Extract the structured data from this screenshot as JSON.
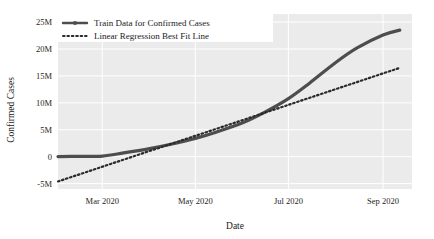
{
  "chart_data": {
    "type": "line",
    "title": "",
    "xlabel": "Date",
    "ylabel": "Confirmed Cases",
    "grid": true,
    "legend_position": "top-left",
    "xlim": [
      "2020-02-01",
      "2020-09-20"
    ],
    "ylim": [
      -6000000,
      26500000
    ],
    "xticks": [
      "Mar 2020",
      "May 2020",
      "Jul 2020",
      "Sep 2020"
    ],
    "xtick_values": [
      "2020-03-01",
      "2020-05-01",
      "2020-07-01",
      "2020-09-01"
    ],
    "yticks": [
      "-5M",
      "0",
      "5M",
      "10M",
      "15M",
      "20M",
      "25M"
    ],
    "ytick_values": [
      -5000000,
      0,
      5000000,
      10000000,
      15000000,
      20000000,
      25000000
    ],
    "series": [
      {
        "name": "Train Data for Confirmed Cases",
        "style": "solid",
        "color": "#4d4d4d",
        "width": 3.2,
        "marker": "circle",
        "x": [
          "2020-02-01",
          "2020-02-15",
          "2020-03-01",
          "2020-03-15",
          "2020-04-01",
          "2020-04-15",
          "2020-05-01",
          "2020-05-15",
          "2020-06-01",
          "2020-06-15",
          "2020-07-01",
          "2020-07-15",
          "2020-08-01",
          "2020-08-15",
          "2020-09-01",
          "2020-09-12"
        ],
        "values": [
          20000,
          60000,
          120000,
          700000,
          1500000,
          2300000,
          3400000,
          4600000,
          6300000,
          8200000,
          10800000,
          13700000,
          17500000,
          20200000,
          22600000,
          23500000
        ]
      },
      {
        "name": "Linear Regression Best Fit Line",
        "style": "dotted",
        "color": "#2b2b2b",
        "width": 2.2,
        "marker": "none",
        "x": [
          "2020-02-01",
          "2020-09-12"
        ],
        "values": [
          -4600000,
          16500000
        ]
      }
    ],
    "annotations": [
      {
        "label": "lines-cross",
        "x": "2020-07-10",
        "y": 11900000
      }
    ]
  },
  "legend": {
    "items": [
      {
        "label": "Train Data for Confirmed Cases",
        "style": "solid",
        "marker": "circle",
        "color": "#4d4d4d"
      },
      {
        "label": "Linear Regression Best Fit Line",
        "style": "dotted",
        "marker": "none",
        "color": "#2b2b2b"
      }
    ]
  },
  "style": {
    "plot_background": "#ebebeb",
    "figure_background": "#ffffff",
    "gridline_color": "#ffffff",
    "legend_background": "#ffffff",
    "tick_text_color": "#262626"
  }
}
